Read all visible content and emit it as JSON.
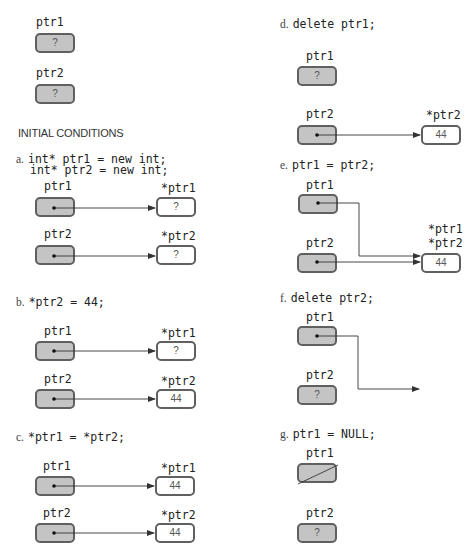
{
  "initial": {
    "ptr1_label": "ptr1",
    "ptr1_value": "?",
    "ptr2_label": "ptr2",
    "ptr2_value": "?",
    "heading": "INITIAL CONDITIONS"
  },
  "steps": {
    "a": {
      "letter": "a.",
      "code_line1": "int* ptr1 = new int;",
      "code_line2": "int* ptr2 = new int;",
      "ptr1_label": "ptr1",
      "ptr2_label": "ptr2",
      "deref1_label": "*ptr1",
      "deref2_label": "*ptr2",
      "deref1_value": "?",
      "deref2_value": "?"
    },
    "b": {
      "letter": "b.",
      "code": "*ptr2 = 44;",
      "ptr1_label": "ptr1",
      "ptr2_label": "ptr2",
      "deref1_label": "*ptr1",
      "deref2_label": "*ptr2",
      "deref1_value": "?",
      "deref2_value": "44"
    },
    "c": {
      "letter": "c.",
      "code": "*ptr1 = *ptr2;",
      "ptr1_label": "ptr1",
      "ptr2_label": "ptr2",
      "deref1_label": "*ptr1",
      "deref2_label": "*ptr2",
      "deref1_value": "44",
      "deref2_value": "44"
    },
    "d": {
      "letter": "d.",
      "code": "delete ptr1;",
      "ptr1_label": "ptr1",
      "ptr1_value": "?",
      "ptr2_label": "ptr2",
      "deref2_label": "*ptr2",
      "deref2_value": "44"
    },
    "e": {
      "letter": "e.",
      "code": "ptr1 = ptr2;",
      "ptr1_label": "ptr1",
      "ptr2_label": "ptr2",
      "deref1_label": "*ptr1",
      "deref2_label": "*ptr2",
      "deref_value": "44"
    },
    "f": {
      "letter": "f.",
      "code": "delete ptr2;",
      "ptr1_label": "ptr1",
      "ptr2_label": "ptr2",
      "ptr2_value": "?"
    },
    "g": {
      "letter": "g.",
      "code": "ptr1 = NULL;",
      "ptr1_label": "ptr1",
      "ptr2_label": "ptr2",
      "ptr2_value": "?"
    }
  },
  "colors": {
    "pointer_fill": "#c4c4c4",
    "border": "#606060",
    "value_fill": "#ffffff",
    "line": "#333333"
  }
}
